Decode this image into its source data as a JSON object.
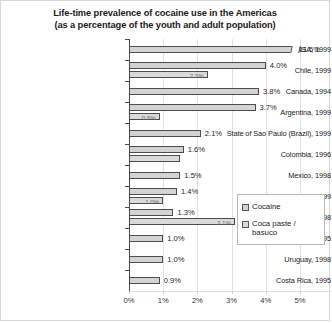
{
  "chart_data": {
    "type": "bar",
    "orientation": "horizontal",
    "title_line1": "Life-time prevalence of cocaine use  in the Americas",
    "title_line2": "(as a percentage of the youth and adult population)",
    "xlabel": "",
    "ylabel": "",
    "xlim": [
      0,
      5.9
    ],
    "grid": true,
    "legend_position": "middle-right",
    "xticks": [
      "0%",
      "1%",
      "2%",
      "3%",
      "4%",
      "5%"
    ],
    "xtick_values": [
      0,
      1,
      2,
      3,
      4,
      5
    ],
    "categories": [
      "USA, 1999",
      "Chile, 1999",
      "Canada, 1994",
      "Argentina, 1999",
      "State of Sao Paulo (Brazil), 1999",
      "Colombia, 1996",
      "Mexico, 1998",
      "Bolivia, 1999",
      "Peru, 1998",
      "Ecuador, 1995",
      "Uruguay, 1998",
      "Costa Rica, 1995"
    ],
    "series": [
      {
        "name": "Cocaine",
        "values": [
          11.5,
          4.0,
          3.8,
          3.7,
          2.1,
          1.6,
          1.5,
          1.4,
          1.3,
          1.0,
          1.0,
          0.9
        ],
        "labels": [
          "11.5%",
          "4.0%",
          "3.8%",
          "3.7%",
          "2.1%",
          "1.6%",
          "1.5%",
          "1.4%",
          "1.3%",
          "1.0%",
          "1.0%",
          "0.9%"
        ],
        "truncated_index": 0
      },
      {
        "name": "Coca paste /\nbasuco",
        "values": [
          null,
          2.3,
          null,
          0.9,
          null,
          1.5,
          null,
          1.0,
          3.1,
          null,
          null,
          null
        ],
        "labels": [
          null,
          "2.3%",
          null,
          "0.9%",
          null,
          null,
          null,
          "1.0%",
          "3.1%",
          null,
          null,
          null
        ]
      }
    ]
  },
  "legend": {
    "items": [
      {
        "label": "Cocaine"
      },
      {
        "label": "Coca paste /\nbasuco"
      }
    ]
  },
  "colors": {
    "cocaine_fill": "#d3d3d3",
    "paste_fill": "#dadada",
    "bar_border": "#4d4d4d",
    "gridline": "#e2e2e2",
    "text": "#1f1f1f"
  }
}
